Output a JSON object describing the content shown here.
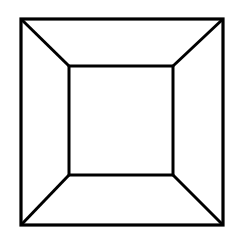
{
  "figure": {
    "stroke_color": "#000000",
    "background_color": "#ffffff",
    "outer_square": {
      "x1": 21,
      "y1": 19,
      "x2": 223,
      "y2": 225
    },
    "inner_square": {
      "x1": 69,
      "y1": 66,
      "x2": 173,
      "y2": 175
    }
  }
}
